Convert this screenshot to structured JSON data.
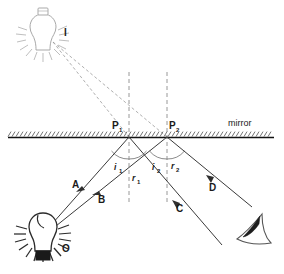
{
  "figure": {
    "type": "optics-ray-diagram",
    "width": 284,
    "height": 274,
    "background": "#ffffff",
    "line_color": "#3a3a3a",
    "construction_color": "#9a9a9a",
    "mirror_color": "#111111"
  },
  "labels": {
    "image_point": "I",
    "object_point": "O",
    "point1": "P",
    "point1_sub": "1",
    "point2": "P",
    "point2_sub": "2",
    "mirror": "mirror",
    "ray_a": "A",
    "ray_b": "B",
    "ray_c": "C",
    "ray_d": "D",
    "angle_i1": "i",
    "angle_i1_sub": "1",
    "angle_r1": "r",
    "angle_r1_sub": "1",
    "angle_i2": "i",
    "angle_i2_sub": "2",
    "angle_r2": "r",
    "angle_r2_sub": "2"
  },
  "geometry": {
    "mirror_y": 137,
    "mirror_x_start": 8,
    "mirror_x_end": 274,
    "object_bulb": {
      "x": 42,
      "y": 233
    },
    "image_bulb": {
      "x": 44,
      "y": 32
    },
    "p1": {
      "x": 129,
      "y": 137
    },
    "p2": {
      "x": 167,
      "y": 137
    },
    "normal1_x": 129,
    "normal2_x": 167,
    "normal_top_y": 72,
    "normal_bottom_y": 205,
    "eye": {
      "x": 252,
      "y": 238
    }
  },
  "rays": [
    {
      "name": "A",
      "from": "O",
      "to": "P1",
      "style": "solid",
      "direction": "incident-up-right"
    },
    {
      "name": "B",
      "from": "O",
      "to": "P2",
      "style": "solid",
      "direction": "incident-up-right"
    },
    {
      "name": "C",
      "from": "P1",
      "to": "lower-right",
      "style": "solid",
      "direction": "reflected-down-right"
    },
    {
      "name": "D",
      "from": "P2",
      "to": "lower-right",
      "style": "solid",
      "direction": "reflected-down-right"
    },
    {
      "name": "virtual-1",
      "from": "I",
      "to": "P1",
      "style": "dashed",
      "direction": "construction"
    },
    {
      "name": "virtual-2",
      "from": "I",
      "to": "P2",
      "style": "dashed",
      "direction": "construction"
    }
  ]
}
